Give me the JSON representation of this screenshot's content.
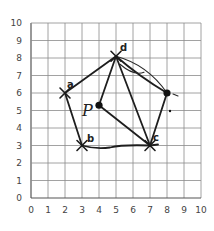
{
  "diagram": {
    "type": "coordinate-geometry-sketch",
    "grid": {
      "x_min": 0,
      "x_max": 10,
      "y_min": 0,
      "y_max": 10,
      "x_ticks": [
        "0",
        "1",
        "2",
        "3",
        "4",
        "5",
        "6",
        "7",
        "8",
        "9",
        "10"
      ],
      "y_ticks": [
        "0",
        "1",
        "2",
        "3",
        "4",
        "5",
        "6",
        "7",
        "8",
        "9",
        "10"
      ],
      "grid_color": "#8a8a8a"
    },
    "points": [
      {
        "id": "a",
        "label": "a",
        "x": 2,
        "y": 6,
        "marker": "x"
      },
      {
        "id": "b",
        "label": "b",
        "x": 3,
        "y": 3,
        "marker": "x"
      },
      {
        "id": "c",
        "label": "c",
        "x": 7,
        "y": 3,
        "marker": "x"
      },
      {
        "id": "d",
        "label": "d",
        "x": 5,
        "y": 8.1,
        "marker": "x"
      },
      {
        "id": "e",
        "label": "",
        "x": 8,
        "y": 6,
        "marker": "dot"
      },
      {
        "id": "P",
        "label": "P",
        "x": 4,
        "y": 5.3,
        "marker": "dot"
      }
    ],
    "segments": [
      {
        "from": "a",
        "to": "d"
      },
      {
        "from": "d",
        "to": "e",
        "style": "double-curved"
      },
      {
        "from": "e",
        "to": "c"
      },
      {
        "from": "c",
        "to": "b"
      },
      {
        "from": "b",
        "to": "a"
      },
      {
        "from": "d",
        "to": "c"
      },
      {
        "from": "P",
        "to": "d"
      },
      {
        "from": "P",
        "to": "c"
      }
    ],
    "labels": {
      "a": "a",
      "b": "b",
      "c": "c",
      "d": "d",
      "P": "P"
    },
    "ink_color": "#1e1e1e"
  }
}
